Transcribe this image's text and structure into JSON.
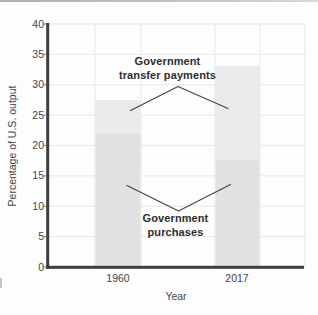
{
  "figure": {
    "background": "#fdfdfd"
  },
  "chart_data": {
    "type": "bar",
    "stacked": true,
    "title": "",
    "xlabel": "Year",
    "ylabel": "Percentage of U.S. output",
    "categories": [
      "1960",
      "2017"
    ],
    "series": [
      {
        "name": "Government purchases",
        "values": [
          22,
          17.6
        ],
        "color": "#e0e1e2"
      },
      {
        "name": "Government transfer payments",
        "values": [
          5.5,
          15.5
        ],
        "color": "#e9eaeb"
      }
    ],
    "totals": [
      27.5,
      33.1
    ],
    "ylim": [
      0,
      40
    ],
    "yticks": [
      0,
      5,
      10,
      15,
      20,
      25,
      30,
      35,
      40
    ],
    "grid": true,
    "legend_position": "none",
    "annotations": [
      {
        "id": "transfers",
        "lines": [
          "Government",
          "transfer payments"
        ]
      },
      {
        "id": "purchases",
        "lines": [
          "Government",
          "purchases"
        ]
      }
    ],
    "colors": {
      "axis": "#3d3e3f",
      "grid": "#e7e7e7",
      "tick_text": "#454648",
      "annotation_text": "#2e2f30",
      "annotation_line": "#474747"
    }
  }
}
